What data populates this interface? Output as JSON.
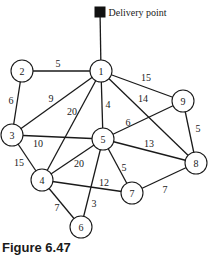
{
  "delivery_point": {
    "label": "Delivery point",
    "x": 100,
    "y": 10,
    "size": 11,
    "connects_to": "1"
  },
  "nodes": [
    {
      "id": "1",
      "x": 101,
      "y": 71
    },
    {
      "id": "2",
      "x": 22,
      "y": 71
    },
    {
      "id": "3",
      "x": 12,
      "y": 135
    },
    {
      "id": "4",
      "x": 42,
      "y": 180
    },
    {
      "id": "5",
      "x": 103,
      "y": 139
    },
    {
      "id": "6",
      "x": 81,
      "y": 227
    },
    {
      "id": "7",
      "x": 132,
      "y": 193
    },
    {
      "id": "8",
      "x": 196,
      "y": 163
    },
    {
      "id": "9",
      "x": 183,
      "y": 101
    }
  ],
  "edges": [
    {
      "from": "1",
      "to": "2",
      "weight": "5",
      "lx": 58,
      "ly": 63
    },
    {
      "from": "1",
      "to": "3",
      "weight": "9",
      "lx": 51,
      "ly": 98
    },
    {
      "from": "1",
      "to": "4",
      "weight": "20",
      "lx": 72,
      "ly": 111
    },
    {
      "from": "1",
      "to": "5",
      "weight": "4",
      "lx": 108,
      "ly": 104
    },
    {
      "from": "1",
      "to": "9",
      "weight": "15",
      "lx": 146,
      "ly": 77
    },
    {
      "from": "1",
      "to": "8",
      "weight": "14",
      "lx": 143,
      "ly": 98
    },
    {
      "from": "2",
      "to": "3",
      "weight": "6",
      "lx": 11,
      "ly": 100
    },
    {
      "from": "3",
      "to": "5",
      "weight": "10",
      "lx": 38,
      "ly": 143
    },
    {
      "from": "3",
      "to": "4",
      "weight": "15",
      "lx": 19,
      "ly": 162
    },
    {
      "from": "5",
      "to": "9",
      "weight": "6",
      "lx": 128,
      "ly": 122
    },
    {
      "from": "5",
      "to": "8",
      "weight": "13",
      "lx": 149,
      "ly": 143
    },
    {
      "from": "5",
      "to": "4",
      "weight": "20",
      "lx": 79,
      "ly": 163
    },
    {
      "from": "5",
      "to": "7",
      "weight": "5",
      "lx": 124,
      "ly": 167
    },
    {
      "from": "5",
      "to": "6",
      "weight": "3",
      "lx": 94,
      "ly": 203
    },
    {
      "from": "4",
      "to": "7",
      "weight": "12",
      "lx": 104,
      "ly": 182
    },
    {
      "from": "4",
      "to": "6",
      "weight": "7",
      "lx": 57,
      "ly": 207
    },
    {
      "from": "9",
      "to": "8",
      "weight": "5",
      "lx": 198,
      "ly": 128
    },
    {
      "from": "7",
      "to": "8",
      "weight": "7",
      "lx": 165,
      "ly": 189
    }
  ],
  "node_radius": 11,
  "caption": "Figure 6.47"
}
